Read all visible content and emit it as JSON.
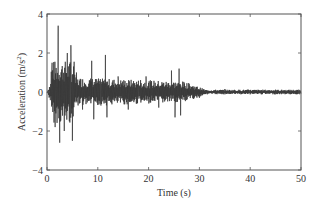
{
  "chart_data": {
    "type": "line",
    "title": "",
    "xlabel": "Time (s)",
    "ylabel": "Acceleration (m/s²)",
    "xlim": [
      0,
      50
    ],
    "ylim": [
      -4,
      4
    ],
    "x_ticks": [
      0,
      10,
      20,
      30,
      40,
      50
    ],
    "y_ticks": [
      -4,
      -2,
      0,
      2,
      4
    ],
    "grid": false,
    "legend": null,
    "series": [
      {
        "name": "Ground acceleration record",
        "color": "#333333",
        "description": "Earthquake accelerogram; strong shaking 0-5 s (peaks ~+3.4 / -2.6 m/s^2), moderate 5-27 s (amplitude ~±1), decaying to ~±0.1 after 30 s",
        "key_points": [
          {
            "t": 0.0,
            "a": 0.0
          },
          {
            "t": 1.0,
            "a": 1.5
          },
          {
            "t": 1.6,
            "a": -1.8
          },
          {
            "t": 2.2,
            "a": 3.4
          },
          {
            "t": 2.5,
            "a": -2.6
          },
          {
            "t": 3.0,
            "a": 1.2
          },
          {
            "t": 3.4,
            "a": -2.0
          },
          {
            "t": 4.0,
            "a": 2.0
          },
          {
            "t": 4.4,
            "a": -1.5
          },
          {
            "t": 4.7,
            "a": 2.4
          },
          {
            "t": 5.0,
            "a": -2.5
          },
          {
            "t": 5.8,
            "a": 1.0
          },
          {
            "t": 7.0,
            "a": -0.9
          },
          {
            "t": 8.8,
            "a": 1.6
          },
          {
            "t": 9.2,
            "a": -1.4
          },
          {
            "t": 11.5,
            "a": 1.9
          },
          {
            "t": 11.8,
            "a": -1.3
          },
          {
            "t": 14.0,
            "a": 0.8
          },
          {
            "t": 16.0,
            "a": -0.9
          },
          {
            "t": 19.5,
            "a": 0.8
          },
          {
            "t": 22.0,
            "a": -0.8
          },
          {
            "t": 24.5,
            "a": 1.1
          },
          {
            "t": 25.2,
            "a": -1.3
          },
          {
            "t": 26.0,
            "a": 1.2
          },
          {
            "t": 26.3,
            "a": -1.2
          },
          {
            "t": 28.0,
            "a": 0.4
          },
          {
            "t": 30.0,
            "a": -0.3
          },
          {
            "t": 35.0,
            "a": 0.15
          },
          {
            "t": 40.0,
            "a": -0.12
          },
          {
            "t": 45.0,
            "a": 0.12
          },
          {
            "t": 50.0,
            "a": 0.0
          }
        ]
      }
    ]
  },
  "axes": {
    "xlabel": "Time (s)",
    "ylabel_main": "Acceleration (m/s",
    "ylabel_sup": "2",
    "ylabel_close": ")",
    "x_tick_labels": [
      "0",
      "10",
      "20",
      "30",
      "40",
      "50"
    ],
    "y_tick_labels": [
      "4",
      "2",
      "0",
      "−2",
      "−4"
    ]
  }
}
